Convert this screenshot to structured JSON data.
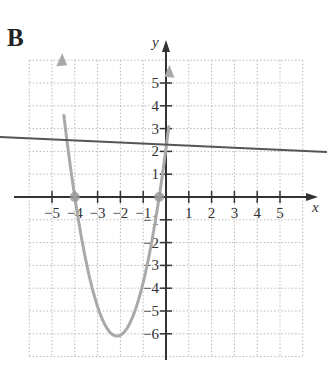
{
  "figure": {
    "label": "B"
  },
  "axes": {
    "x_name": "x",
    "y_name": "y",
    "x_tick_labels": [
      "−5",
      "−4",
      "−3",
      "−2",
      "−1",
      "1",
      "2",
      "3",
      "4",
      "5"
    ],
    "y_tick_labels": [
      "5",
      "4",
      "3",
      "2",
      "1",
      "−1",
      "−2",
      "−3",
      "−4",
      "−5",
      "−6"
    ]
  },
  "chart_data": {
    "type": "line",
    "title": "B",
    "xlabel": "x",
    "ylabel": "y",
    "xlim": [
      -6,
      6
    ],
    "ylim": [
      -7,
      6
    ],
    "grid": true,
    "x_ticks": [
      -5,
      -4,
      -3,
      -2,
      -1,
      1,
      2,
      3,
      4,
      5
    ],
    "y_ticks": [
      5,
      4,
      3,
      2,
      1,
      -1,
      -2,
      -3,
      -4,
      -5,
      -6
    ],
    "series": [
      {
        "name": "parabola",
        "kind": "quadratic",
        "equation": "y = (x + 4)(x + 0.3) approx, vertex near (-2, -6)",
        "color": "#a9a9a9",
        "x_intercepts": [
          -4,
          -0.3
        ],
        "vertex": [
          -2.1,
          -6.1
        ],
        "points": [
          [
            -4.5,
            6
          ],
          [
            -4,
            0
          ],
          [
            -3,
            -4.5
          ],
          [
            -2.1,
            -6.1
          ],
          [
            -1,
            -4.2
          ],
          [
            -0.3,
            0
          ],
          [
            0,
            5.5
          ]
        ],
        "arrows": "both ends"
      },
      {
        "name": "line",
        "kind": "linear",
        "color": "#555555",
        "points": [
          [
            -7.2,
            2.55
          ],
          [
            7.2,
            1.9
          ]
        ]
      }
    ],
    "marked_points": [
      [
        -4,
        0
      ],
      [
        -0.3,
        0
      ]
    ]
  }
}
